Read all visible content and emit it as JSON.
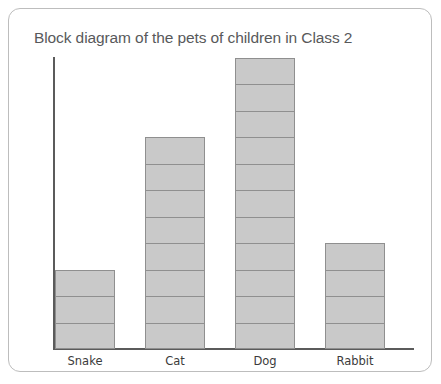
{
  "chart_data": {
    "type": "bar",
    "title": "Block diagram of the pets of children in Class 2",
    "xlabel": "",
    "ylabel": "Number of children",
    "categories": [
      "Snake",
      "Cat",
      "Dog",
      "Rabbit"
    ],
    "values": [
      3,
      8,
      11,
      4
    ],
    "ylim": [
      0,
      11
    ],
    "grid": false,
    "legend": false,
    "note": "Block diagram / pictogram style bar chart: each bar is drawn as a stack of equal unit blocks, one block per child.",
    "block_unit": 1,
    "colors": {
      "block_fill": "#c9c9c9",
      "block_outline": "#8f8f8f",
      "axis": "#5b5b5b",
      "title_text": "#58595b",
      "label_text": "#3b3b3b",
      "card_border": "#bdbdbd",
      "background": "#ffffff"
    }
  }
}
